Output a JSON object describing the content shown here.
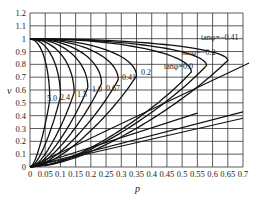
{
  "chart_data": {
    "type": "line",
    "title": "",
    "xlabel": "p",
    "ylabel": "v",
    "xlim": [
      0,
      0.7
    ],
    "ylim": [
      0,
      1.2
    ],
    "grid": true,
    "legend": "none (inline curve labels)",
    "x_ticks": [
      "0",
      "0.05",
      "0.1",
      "0.15",
      "0.2",
      "0.25",
      "0.3",
      "0.35",
      "0.4",
      "0.45",
      "0.5",
      "0.55",
      "0.6",
      "0.65",
      "0.7"
    ],
    "y_ticks": [
      "0",
      "0.1",
      "0.2",
      "0.3",
      "0.4",
      "0.5",
      "0.6",
      "0.7",
      "0.8",
      "0.9",
      "1",
      "1.1",
      "1.2"
    ],
    "series": [
      {
        "name": "tanφ=5.0",
        "label": "5.0",
        "p_max": 0.065,
        "v_at_max": 0.52
      },
      {
        "name": "tanφ=2.4",
        "label": "2.4",
        "p_max": 0.1,
        "v_at_max": 0.55
      },
      {
        "name": "tanφ=1.5",
        "label": "1.5",
        "p_max": 0.145,
        "v_at_max": 0.58
      },
      {
        "name": "tanφ=1.0",
        "label": "1.0",
        "p_max": 0.19,
        "v_at_max": 0.62
      },
      {
        "name": "tanφ=0.67",
        "label": "0.67",
        "p_max": 0.235,
        "v_at_max": 0.65
      },
      {
        "name": "tanφ=0.41",
        "label": "0.41",
        "p_max": 0.29,
        "v_at_max": 0.68
      },
      {
        "name": "tanφ=0.2",
        "label": "0.2",
        "p_max": 0.35,
        "v_at_max": 0.71
      },
      {
        "name": "tanφ=0.0",
        "label": "tanφ=0.0",
        "p_max": 0.53,
        "v_at_max": 0.74
      },
      {
        "name": "tanφ=-0.2",
        "label": "tanφ=−0.2",
        "p_max": 0.58,
        "v_at_max": 0.79
      },
      {
        "name": "tanφ=-0.41",
        "label": "tanφ=−0.41",
        "p_max": 0.65,
        "v_at_max": 0.83
      }
    ]
  },
  "labels": {
    "x_axis": "p",
    "y_axis": "v",
    "c50": "5.0",
    "c24": "2.4",
    "c15": "1.5",
    "c10": "1.0",
    "c067": "0.67",
    "c041": "0.41",
    "c02": "0.2",
    "c00": "tanφ=0.0",
    "cm02": "tanφ=−0.2",
    "cm041": "tanφ=−0.41"
  }
}
